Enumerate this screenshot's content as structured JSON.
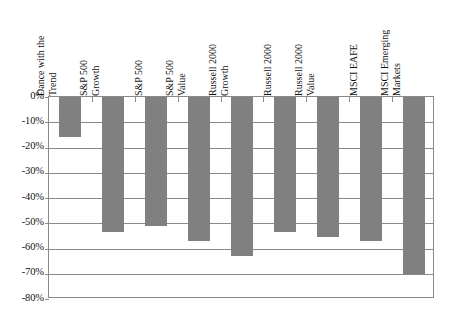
{
  "chart_data": {
    "type": "bar",
    "title": "",
    "subtitle": "",
    "xlabel": "",
    "ylabel": "",
    "categories": [
      "Dance with the Trend",
      "S&P 500 Growth",
      "S&P 500",
      "S&P 500 Value",
      "Russell 2000 Growth",
      "Russell 2000",
      "Russell 2000 Value",
      "MSCI EAFE",
      "MSCI Emerging Markets"
    ],
    "category_lines": [
      [
        "Dance with the",
        "Trend"
      ],
      [
        "S&P 500",
        "Growth"
      ],
      [
        "S&P 500",
        ""
      ],
      [
        "S&P 500",
        "Value"
      ],
      [
        "Russell 2000",
        "Growth"
      ],
      [
        "Russell 2000",
        ""
      ],
      [
        "Russell 2000",
        "Value"
      ],
      [
        "MSCI EAFE",
        ""
      ],
      [
        "MSCI Emerging",
        "Markets"
      ]
    ],
    "values": [
      -15.8,
      -53.4,
      -51.2,
      -57.2,
      -63.0,
      -53.4,
      -55.5,
      -57.0,
      -70.0
    ],
    "ylim": [
      -80,
      0
    ],
    "ytick_values": [
      0,
      -10,
      -20,
      -30,
      -40,
      -50,
      -60,
      -70,
      -80
    ],
    "ytick_labels": [
      "0%",
      "-10%",
      "-20%",
      "-30%",
      "-40%",
      "-50%",
      "-60%",
      "-70%",
      "-80%"
    ],
    "grid": true,
    "legend": false,
    "legend_position": "none",
    "bar_color": "#808080",
    "axis_color": "#8a8a8a",
    "plot_background": "#ffffff"
  }
}
